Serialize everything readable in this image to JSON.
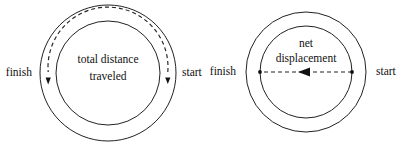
{
  "figure": {
    "background_color": "#ffffff",
    "line_color": "#222222",
    "width": 406,
    "height": 150
  },
  "diagrams": [
    {
      "id": "total-distance",
      "center_x": 108,
      "center_y": 73,
      "outer_radius": 68,
      "inner_radius": 52,
      "path_radius": 60,
      "path_type": "arc",
      "path_description": "dashed circular arc around the full track from start to finish",
      "caption_line1": "total distance",
      "caption_line2": "traveled",
      "left_label": "finish",
      "right_label": "start",
      "left_label_x": 32,
      "right_label_x": 182,
      "label_y": 73,
      "arrow_direction": "counterclockwise-to-finish"
    },
    {
      "id": "net-displacement",
      "center_x": 306,
      "center_y": 72,
      "outer_radius": 60,
      "inner_radius": 46,
      "path_type": "line",
      "path_description": "dashed straight line across the diameter with arrowhead pointing left toward finish",
      "caption_line1": "net",
      "caption_line2": "displacement",
      "left_label": "finish",
      "right_label": "start",
      "left_label_x": 236,
      "right_label_x": 376,
      "label_y": 72,
      "arrow_direction": "left"
    }
  ]
}
